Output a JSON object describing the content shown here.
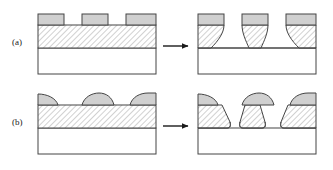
{
  "figure": {
    "type": "schematic-diagram",
    "width": 333,
    "height": 170,
    "background_color": "#ffffff",
    "line_color": "#333333",
    "mask_fill_color": "#d0d0d0",
    "film_fill_color": "#ffffff",
    "film_hatch_color": "#9a9a9a",
    "substrate_fill_color": "#ffffff"
  },
  "rows": [
    {
      "id": "a",
      "label": "(a)",
      "before": {
        "name": "vertical-sidewall-mask-stack",
        "mask_shape": "rectangular",
        "mask_count": 3,
        "layers": [
          "mask",
          "film",
          "substrate"
        ]
      },
      "arrow": {
        "name": "process-arrow",
        "direction": "right",
        "label": ""
      },
      "after": {
        "name": "isotropic-undercut-etch-profile",
        "sidewall_shape": "concave-undercut",
        "mask_count": 3,
        "layers": [
          "mask",
          "film",
          "substrate"
        ]
      }
    },
    {
      "id": "b",
      "label": "(b)",
      "before": {
        "name": "rounded-mask-stack",
        "mask_shape": "domed",
        "mask_count": 3,
        "layers": [
          "mask",
          "film",
          "substrate"
        ]
      },
      "arrow": {
        "name": "process-arrow",
        "direction": "right",
        "label": ""
      },
      "after": {
        "name": "tapered-sloped-etch-profile",
        "sidewall_shape": "tapered-sloped",
        "mask_count": 3,
        "layers": [
          "mask",
          "film",
          "substrate"
        ]
      }
    }
  ],
  "legend": {
    "mask_label": "",
    "film_label": "",
    "substrate_label": ""
  }
}
